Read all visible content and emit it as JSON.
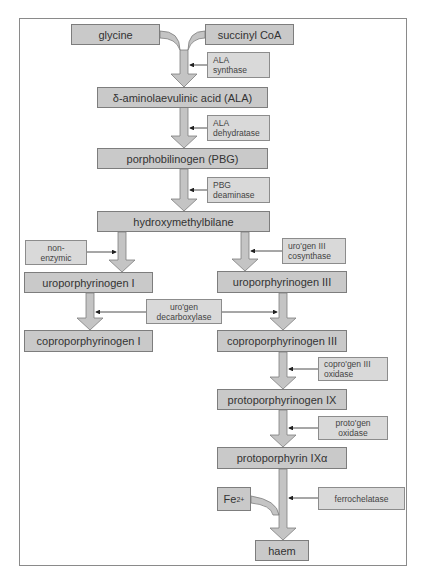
{
  "diagram": {
    "colors": {
      "node_fill": "#c9c9c9",
      "enzyme_fill": "#d9d9d9",
      "border": "#7d7d7d",
      "arrow_fill": "#c4c4c4"
    },
    "substrates": {
      "glycine": "glycine",
      "succinyl_coa": "succinyl CoA",
      "ala": "δ-aminolaevulinic acid (ALA)",
      "pbg": "porphobilinogen (PBG)",
      "hmb": "hydroxymethylbilane",
      "uro1": "uroporphyrinogen I",
      "uro3": "uroporphyrinogen III",
      "copro1": "coproporphyrinogen I",
      "copro3": "coproporphyrinogen III",
      "proto9": "protoporphyrinogen IX",
      "protoporphyrin": "protoporphyrin IXα",
      "fe_base": "Fe",
      "fe_charge": "2+",
      "haem": "haem"
    },
    "enzymes": {
      "ala_synthase": [
        "ALA",
        "synthase"
      ],
      "ala_dehydratase": [
        "ALA",
        "dehydratase"
      ],
      "pbg_deaminase": [
        "PBG",
        "deaminase"
      ],
      "non_enzymic": [
        "non-",
        "enzymic"
      ],
      "urogen3_cosynthase": [
        "uro'gen III",
        "cosynthase"
      ],
      "urogen_decarboxylase": [
        "uro'gen",
        "decarboxylase"
      ],
      "coprogen3_oxidase": [
        "copro'gen III",
        "oxidase"
      ],
      "protogen_oxidase": [
        "proto'gen",
        "oxidase"
      ],
      "ferrochelatase": [
        "ferrochelatase"
      ]
    }
  }
}
